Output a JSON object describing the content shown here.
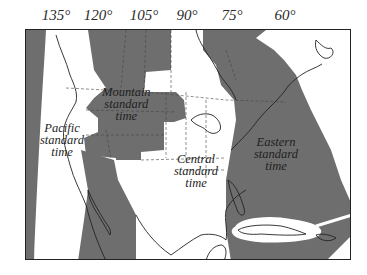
{
  "map": {
    "title": "North American standard time zones",
    "longitude_labels": [
      "135°",
      "120°",
      "105°",
      "90°",
      "75°",
      "60°"
    ],
    "zones": [
      {
        "name": "Pacific",
        "lines": [
          "Pacific",
          "standard",
          "time"
        ]
      },
      {
        "name": "Mountain",
        "lines": [
          "Mountain",
          "standard",
          "time"
        ]
      },
      {
        "name": "Central",
        "lines": [
          "Central",
          "standard",
          "time"
        ]
      },
      {
        "name": "Eastern",
        "lines": [
          "Eastern",
          "standard",
          "time"
        ]
      }
    ],
    "colors": {
      "shaded_zone": "#6e6e6e",
      "unshaded_zone": "#ffffff",
      "boundary": "#222222",
      "frame": "#222222"
    }
  }
}
